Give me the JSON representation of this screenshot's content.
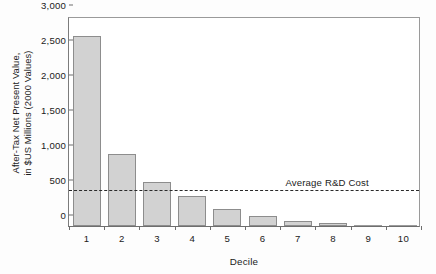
{
  "chart_data": {
    "type": "bar",
    "title": "",
    "xlabel": "Decile",
    "ylabel": "After-Tax Net Present Value, in $US Millions (2000 Values)",
    "ylabel_lines": [
      "After-Tax Net Present Value,",
      "in $US Millions (2000 Values)"
    ],
    "categories": [
      "1",
      "2",
      "3",
      "4",
      "5",
      "6",
      "7",
      "8",
      "9",
      "10"
    ],
    "values": [
      2720,
      1030,
      625,
      430,
      245,
      145,
      70,
      40,
      10,
      0
    ],
    "ylim": [
      0,
      3000
    ],
    "yticks": [
      0,
      500,
      1000,
      1500,
      2000,
      2500,
      3000
    ],
    "ytick_labels": [
      "0",
      "500",
      "1,000",
      "1,500",
      "2,000",
      "2,500",
      "3,000"
    ],
    "grid": false,
    "legend_position": "none",
    "annotations": [
      {
        "name": "average-rd-cost-line",
        "type": "hline",
        "value": 500,
        "label": "Average R&D Cost",
        "style": "dashed"
      }
    ],
    "colors": {
      "bar_fill": "#d2d2d2",
      "bar_edge": "#8d8d8d",
      "axis": "#6e6e6e",
      "reference_line": "#2a2a2a",
      "text": "#1b1b1b",
      "background": "#ffffff"
    }
  }
}
